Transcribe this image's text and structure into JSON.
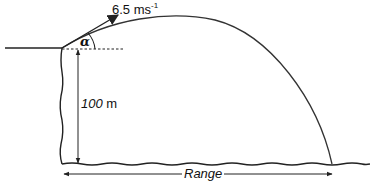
{
  "diagram": {
    "type": "projectile-from-cliff",
    "labels": {
      "speed_value": "6.5 ms",
      "speed_exponent": "-1",
      "angle": "α",
      "height_value": "100",
      "height_unit": "m",
      "range": "Range"
    },
    "colors": {
      "line": "#222222",
      "background": "#ffffff"
    }
  }
}
